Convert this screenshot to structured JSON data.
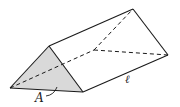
{
  "diagram": {
    "shape": "triangular-prism",
    "colors": {
      "stroke": "#1a1a1a",
      "face_fill": "#d9d9d9",
      "background": "#ffffff"
    },
    "labels": {
      "area": "A",
      "length": "ℓ"
    },
    "vertices": {
      "front_left": [
        10,
        88
      ],
      "front_apex": [
        49,
        46
      ],
      "front_right": [
        83,
        92
      ],
      "back_left_hidden": [
        94,
        50
      ],
      "back_apex": [
        133,
        9
      ],
      "back_right": [
        168,
        55
      ]
    },
    "edges": {
      "visible": [
        [
          "front_left",
          "front_apex"
        ],
        [
          "front_apex",
          "front_right"
        ],
        [
          "front_left",
          "front_right"
        ],
        [
          "front_apex",
          "back_apex"
        ],
        [
          "back_apex",
          "back_right"
        ],
        [
          "front_right",
          "back_right"
        ]
      ],
      "hidden": [
        [
          "front_left",
          "back_left_hidden"
        ],
        [
          "back_left_hidden",
          "back_apex"
        ],
        [
          "back_left_hidden",
          "back_right"
        ]
      ]
    }
  }
}
